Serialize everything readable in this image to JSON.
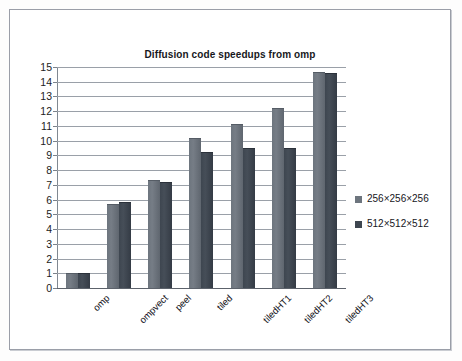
{
  "chart_data": {
    "type": "bar",
    "title": "Diffusion code speedups from omp",
    "xlabel": "",
    "ylabel": "",
    "ylim": [
      0,
      15
    ],
    "grid": true,
    "legend_position": "right",
    "categories": [
      "omp",
      "ompvect",
      "peel",
      "tiled",
      "tiledHT1",
      "tiledHT2",
      "tiledHT3"
    ],
    "ytick_labels": [
      "15",
      "14",
      "13",
      "12",
      "11",
      "10",
      "9",
      "8",
      "7",
      "6",
      "5",
      "4",
      "3",
      "2",
      "1",
      "0"
    ],
    "yticks": [
      15,
      14,
      13,
      12,
      11,
      10,
      9,
      8,
      7,
      6,
      5,
      4,
      3,
      2,
      1,
      0
    ],
    "series": [
      {
        "name": "256×256×256",
        "color": "#6d757e",
        "values": [
          1.0,
          5.7,
          7.3,
          10.2,
          11.1,
          12.25,
          14.65
        ]
      },
      {
        "name": "512×512×512",
        "color": "#3e4650",
        "values": [
          1.0,
          5.85,
          7.2,
          9.25,
          9.5,
          9.5,
          14.6
        ]
      }
    ]
  },
  "legend": {
    "items": [
      {
        "label": "256×256×256",
        "color": "#6d757e"
      },
      {
        "label": "512×512×512",
        "color": "#3e4650"
      }
    ]
  },
  "colors": {
    "series_256": "#6d757e",
    "series_512": "#3e4650",
    "gridline": "#9aa0a8",
    "axis": "#5c626b",
    "frame": "#9a9ea8",
    "text": "#16161c",
    "background": "#ffffff"
  }
}
